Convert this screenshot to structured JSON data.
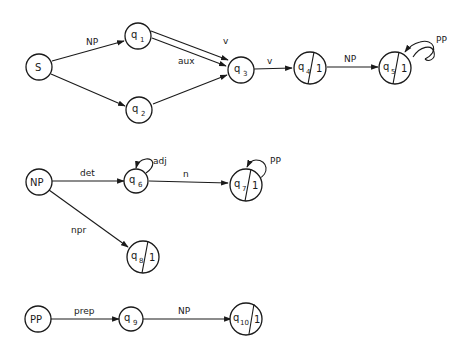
{
  "diagram": {
    "type": "augmented transition network",
    "networks": [
      {
        "name": "S",
        "nodes": [
          {
            "id": "S",
            "label": "S",
            "final": false
          },
          {
            "id": "q1",
            "label": "q",
            "sub": "1",
            "final": false
          },
          {
            "id": "q2",
            "label": "q",
            "sub": "2",
            "final": false
          },
          {
            "id": "q3",
            "label": "q",
            "sub": "3",
            "final": false
          },
          {
            "id": "q4",
            "label": "q",
            "sub": "4",
            "final": true,
            "final_mark": "1"
          },
          {
            "id": "q5",
            "label": "q",
            "sub": "5",
            "final": true,
            "final_mark": "1"
          }
        ],
        "edges": [
          {
            "from": "S",
            "to": "q1",
            "label": "NP"
          },
          {
            "from": "S",
            "to": "q2",
            "label": ""
          },
          {
            "from": "q1",
            "to": "q4",
            "label": "v"
          },
          {
            "from": "q1",
            "to": "q3",
            "label": "aux"
          },
          {
            "from": "q2",
            "to": "q3",
            "label": ""
          },
          {
            "from": "q3",
            "to": "q4",
            "label": "v"
          },
          {
            "from": "q4",
            "to": "q5",
            "label": "NP"
          },
          {
            "from": "q5",
            "to": "q5",
            "label": "PP"
          }
        ]
      },
      {
        "name": "NP",
        "nodes": [
          {
            "id": "NP",
            "label": "NP",
            "final": false
          },
          {
            "id": "q6",
            "label": "q",
            "sub": "6",
            "final": false
          },
          {
            "id": "q7",
            "label": "q",
            "sub": "7",
            "final": true,
            "final_mark": "1"
          },
          {
            "id": "q8",
            "label": "q",
            "sub": "8",
            "final": true,
            "final_mark": "1"
          }
        ],
        "edges": [
          {
            "from": "NP",
            "to": "q6",
            "label": "det"
          },
          {
            "from": "q6",
            "to": "q6",
            "label": "adj"
          },
          {
            "from": "q6",
            "to": "q7",
            "label": "n"
          },
          {
            "from": "q7",
            "to": "q7",
            "label": "PP"
          },
          {
            "from": "NP",
            "to": "q8",
            "label": "npr"
          }
        ]
      },
      {
        "name": "PP",
        "nodes": [
          {
            "id": "PP",
            "label": "PP",
            "final": false
          },
          {
            "id": "q9",
            "label": "q",
            "sub": "9",
            "final": false
          },
          {
            "id": "q10",
            "label": "q",
            "sub": "10",
            "final": true,
            "final_mark": "1"
          }
        ],
        "edges": [
          {
            "from": "PP",
            "to": "q9",
            "label": "prep"
          },
          {
            "from": "q9",
            "to": "q10",
            "label": "NP"
          }
        ]
      }
    ]
  },
  "labels": {
    "S": "S",
    "q": "q",
    "sub1": "1",
    "sub2": "2",
    "sub3": "3",
    "sub4": "4",
    "sub5": "5",
    "sub6": "6",
    "sub7": "7",
    "sub8": "8",
    "sub9": "9",
    "sub10": "10",
    "final_mark": "1",
    "NP": "NP",
    "PP": "PP",
    "edge_S_q1": "NP",
    "edge_q1_q4": "v",
    "edge_q1_q3": "aux",
    "edge_q3_q4": "v",
    "edge_q4_q5": "NP",
    "loop_q5": "PP",
    "edge_NP_q6": "det",
    "loop_q6": "adj",
    "edge_q6_q7": "n",
    "loop_q7": "PP",
    "edge_NP_q8": "npr",
    "edge_PP_q9": "prep",
    "edge_q9_q10": "NP"
  },
  "colors": {
    "ink": "#1a1a1a",
    "background": "#ffffff"
  }
}
